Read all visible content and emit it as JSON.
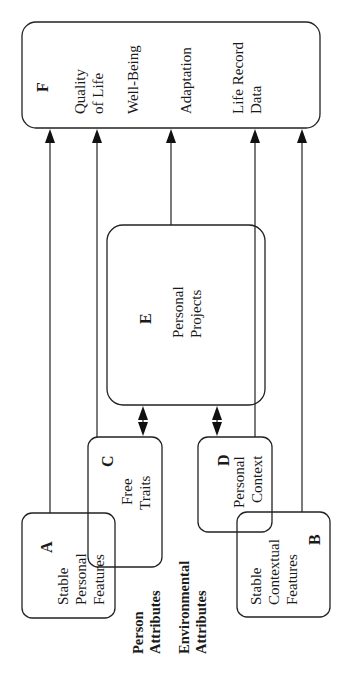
{
  "diagram": {
    "boxes": {
      "A": {
        "letter": "A",
        "line1": "Stable",
        "line2": "Personal",
        "line3": "Features"
      },
      "B": {
        "letter": "B",
        "line1": "Stable",
        "line2": "Contextual",
        "line3": "Features"
      },
      "C": {
        "letter": "C",
        "line1": "Free",
        "line2": "Traits"
      },
      "D": {
        "letter": "D",
        "line1": "Personal",
        "line2": "Context"
      },
      "E": {
        "letter": "E",
        "line1": "Personal",
        "line2": "Projects"
      },
      "F": {
        "letter": "F",
        "item1a": "Quality",
        "item1b": "of Life",
        "item2": "Well-Being",
        "item3": "Adaptation",
        "item4a": "Life Record",
        "item4b": "Data"
      }
    },
    "groups": {
      "person": {
        "line1": "Person",
        "line2": "Attributes"
      },
      "environment": {
        "line1": "Environmental",
        "line2": "Attributes"
      }
    },
    "edges": [
      {
        "from": "A",
        "to": "F",
        "type": "arrow"
      },
      {
        "from": "C",
        "to": "F",
        "type": "arrow"
      },
      {
        "from": "E",
        "to": "F",
        "type": "arrow"
      },
      {
        "from": "D",
        "to": "F",
        "type": "arrow"
      },
      {
        "from": "B",
        "to": "F",
        "type": "arrow"
      },
      {
        "from": "C",
        "to": "E",
        "type": "bidirectional"
      },
      {
        "from": "D",
        "to": "E",
        "type": "bidirectional"
      }
    ],
    "stroke_color": "#222222"
  }
}
